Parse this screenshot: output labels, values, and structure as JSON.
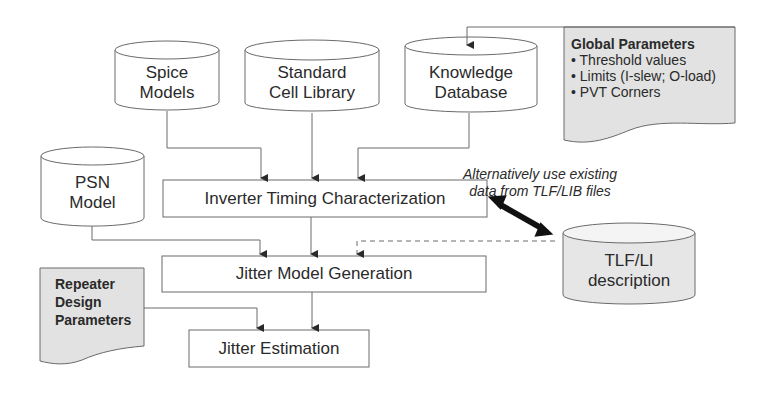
{
  "diagram": {
    "type": "flowchart",
    "colors": {
      "stroke": "#6a6a6a",
      "document_fill": "#e2e2e2",
      "tlf_fill": "#e6e6e6",
      "background": "#ffffff"
    },
    "data_stores": {
      "spice": {
        "line1": "Spice",
        "line2": "Models"
      },
      "stdcell": {
        "line1": "Standard",
        "line2": "Cell Library"
      },
      "knowledge": {
        "line1": "Knowledge",
        "line2": "Database"
      },
      "psn": {
        "line1": "PSN",
        "line2": "Model"
      },
      "tlf": {
        "line1": "TLF/LI",
        "line2": "description"
      }
    },
    "processes": {
      "itc": "Inverter Timing Characterization",
      "jmg": "Jitter Model Generation",
      "je": "Jitter Estimation"
    },
    "documents": {
      "global": {
        "title": "Global Parameters",
        "items": [
          "• Threshold values",
          "• Limits (I-slew; O-load)",
          "• PVT Corners"
        ]
      },
      "repeater": {
        "line1": "Repeater",
        "line2": "Design",
        "line3": "Parameters"
      }
    },
    "annotation": {
      "line1": "Alternatively use existing",
      "line2": "data from TLF/LIB files"
    },
    "edges": [
      {
        "from": "Spice Models",
        "to": "Inverter Timing Characterization"
      },
      {
        "from": "Standard Cell Library",
        "to": "Inverter Timing Characterization"
      },
      {
        "from": "Knowledge Database",
        "to": "Inverter Timing Characterization"
      },
      {
        "from": "Global Parameters",
        "to": "Knowledge Database"
      },
      {
        "from": "PSN Model",
        "to": "Jitter Model Generation"
      },
      {
        "from": "Inverter Timing Characterization",
        "to": "Jitter Model Generation"
      },
      {
        "from": "TLF/LI description",
        "to": "Jitter Model Generation",
        "style": "dashed"
      },
      {
        "from": "Inverter Timing Characterization",
        "to": "TLF/LI description",
        "style": "bidirectional-bold"
      },
      {
        "from": "Repeater Design Parameters",
        "to": "Jitter Estimation"
      },
      {
        "from": "Jitter Model Generation",
        "to": "Jitter Estimation"
      }
    ]
  }
}
